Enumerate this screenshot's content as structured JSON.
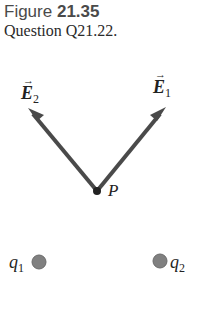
{
  "caption": {
    "figure_prefix": "Figure",
    "figure_number": "21.35",
    "question": "Question Q21.22."
  },
  "diagram": {
    "point_label": "P",
    "vectors": [
      {
        "name": "E",
        "subscript": "2",
        "direction": "up-left"
      },
      {
        "name": "E",
        "subscript": "1",
        "direction": "up-right"
      }
    ],
    "charges": [
      {
        "name": "q",
        "subscript": "1"
      },
      {
        "name": "q",
        "subscript": "2"
      }
    ],
    "arrow_over": "→",
    "colors": {
      "arrow": "#4a4a4a",
      "charge": "#808080",
      "point": "#222222"
    }
  }
}
